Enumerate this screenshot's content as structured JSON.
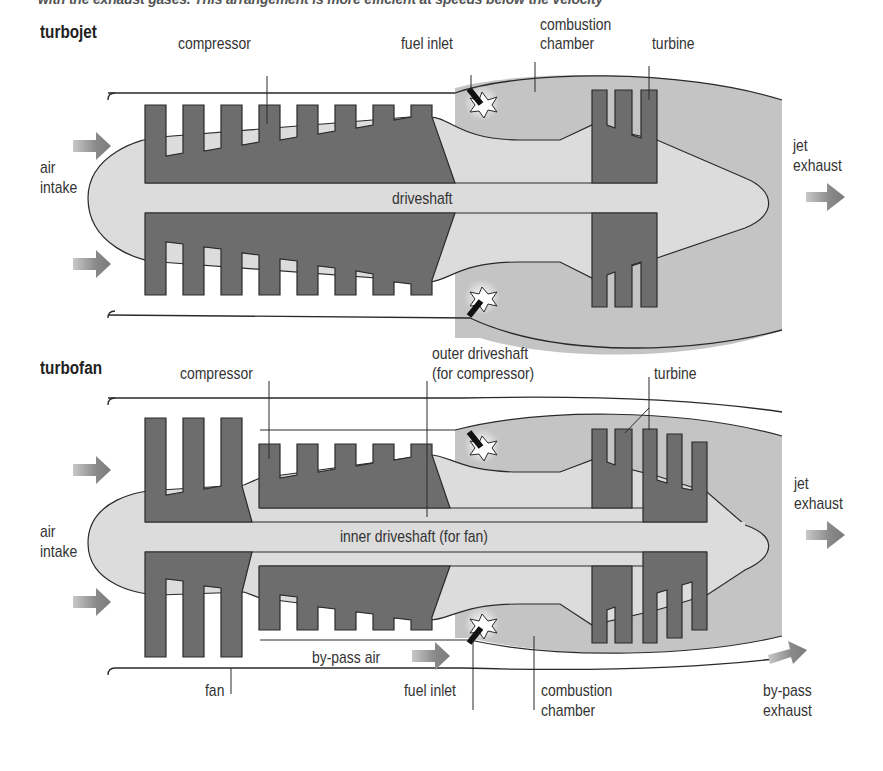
{
  "caption": "with the exhaust gases. This arrangement is more efficient at speeds below the velocity",
  "colors": {
    "metal": "#6d6d6d",
    "shaft": "#dcdcdc",
    "housing": "#c4c4c4",
    "outline": "#2a2a2a",
    "arrow": "#8a8a8a",
    "fuel_nozzle": "#111111"
  },
  "turbojet": {
    "title": "turbojet",
    "labels": {
      "compressor": "compressor",
      "fuel_inlet": "fuel inlet",
      "combustion_chamber_line1": "combustion",
      "combustion_chamber_line2": "chamber",
      "turbine": "turbine",
      "air_intake_line1": "air",
      "air_intake_line2": "intake",
      "driveshaft": "driveshaft",
      "jet_exhaust_line1": "jet",
      "jet_exhaust_line2": "exhaust"
    }
  },
  "turbofan": {
    "title": "turbofan",
    "labels": {
      "compressor": "compressor",
      "outer_driveshaft_line1": "outer driveshaft",
      "outer_driveshaft_line2": "(for compressor)",
      "turbine": "turbine",
      "air_intake_line1": "air",
      "air_intake_line2": "intake",
      "inner_driveshaft": "inner driveshaft (for fan)",
      "jet_exhaust_line1": "jet",
      "jet_exhaust_line2": "exhaust",
      "bypass_air": "by-pass air",
      "fan": "fan",
      "fuel_inlet": "fuel inlet",
      "combustion_chamber_line1": "combustion",
      "combustion_chamber_line2": "chamber",
      "bypass_exhaust_line1": "by-pass",
      "bypass_exhaust_line2": "exhaust"
    }
  },
  "diagram": {
    "components": [
      "air intake",
      "fan",
      "compressor",
      "fuel inlet",
      "combustion chamber",
      "turbine",
      "driveshaft",
      "jet exhaust",
      "by-pass air",
      "by-pass exhaust"
    ]
  }
}
